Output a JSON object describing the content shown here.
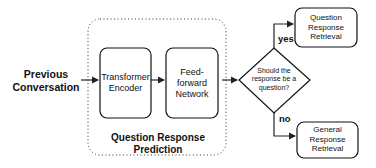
{
  "diagram": {
    "input": {
      "label": "Previous Conversation"
    },
    "module": {
      "title": "Question Response Prediction",
      "blocks": [
        {
          "label": "Transformer Encoder"
        },
        {
          "label": "Feed-forward Network"
        }
      ]
    },
    "decision": {
      "label": "Should the response be a question?"
    },
    "branches": [
      {
        "condition": "yes",
        "target": "Question Response Retrieval"
      },
      {
        "condition": "no",
        "target": "General Response Retrieval"
      }
    ]
  }
}
